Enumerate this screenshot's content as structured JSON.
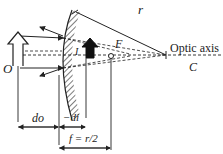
{
  "diagram": {
    "type": "convex-mirror-ray-diagram",
    "labels": {
      "object": "O",
      "image": "I",
      "radius": "r",
      "focal_point": "F",
      "center": "C",
      "optic_axis": "Optic axis",
      "object_distance": "do",
      "image_distance": "−di",
      "focal_length": "f = r/2"
    },
    "colors": {
      "line": "#222222",
      "background": "#ffffff"
    }
  }
}
